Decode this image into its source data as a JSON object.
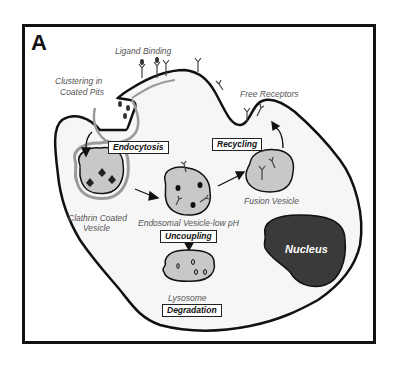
{
  "figure": {
    "panel_letter": "A",
    "labels": {
      "ligand_binding": "Ligand Binding",
      "clustering_line1": "Clustering in",
      "clustering_line2": "Coated Pits",
      "free_receptors": "Free Receptors",
      "clathrin_line1": "Clathrin Coated",
      "clathrin_line2": "Vesicle",
      "endosomal": "Endosomal Vesicle-low pH",
      "fusion": "Fusion Vesicle",
      "lysosome": "Lysosome",
      "nucleus": "Nucleus"
    },
    "process_boxes": {
      "endocytosis": "Endocytosis",
      "recycling": "Recycling",
      "uncoupling": "Uncoupling",
      "degradation": "Degradation"
    },
    "colors": {
      "vesicle_fill": "#c8c8c8",
      "nucleus_fill": "#3a3a3a",
      "cell_fill": "#f6f6f6",
      "outline": "#111111",
      "coat": "#9a9a9a"
    }
  }
}
